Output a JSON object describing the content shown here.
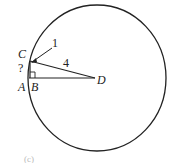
{
  "diagram": {
    "points": {
      "A": "A",
      "B": "B",
      "C": "C",
      "D": "D"
    },
    "labels": {
      "segment_CD": "4",
      "pointer_label": "1",
      "unknown_arc": "?"
    },
    "footer_text": "(c)",
    "colors": {
      "stroke": "#222222",
      "background": "#ffffff"
    }
  }
}
